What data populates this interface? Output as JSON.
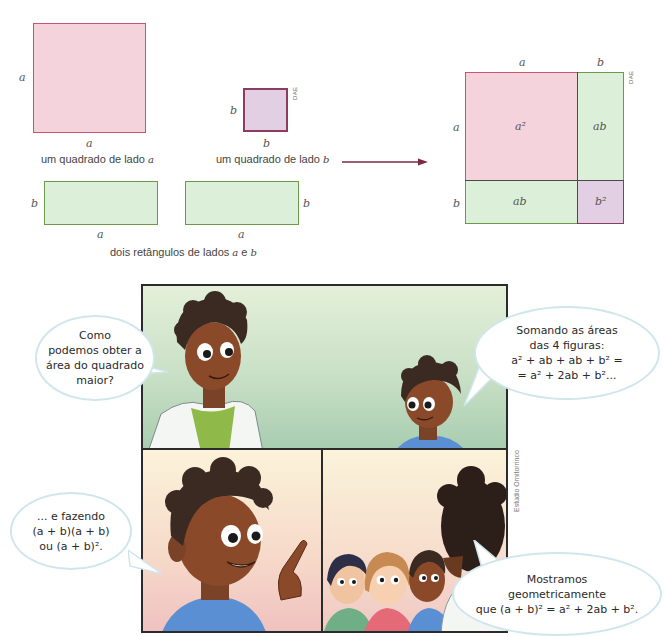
{
  "figures": {
    "square_a": {
      "side_label_left": "a",
      "side_label_bottom": "a",
      "caption_text": "um quadrado de lado ",
      "caption_var": "a",
      "color": "#f5d3dc",
      "border": "#c9556e"
    },
    "square_b": {
      "side_label_left": "b",
      "side_label_bottom": "b",
      "caption_text": "um quadrado de lado ",
      "caption_var": "b",
      "credit": "DAE",
      "color": "#e2cfe3",
      "border": "#8a3d5c"
    },
    "rectangles": {
      "rect1": {
        "side_label": "b",
        "bottom_label": "a"
      },
      "rect2": {
        "side_label": "b",
        "bottom_label": "a"
      },
      "caption_prefix": "dois retângulos de lados ",
      "caption_var1": "a",
      "caption_mid": " e ",
      "caption_var2": "b",
      "color": "#dcefd9",
      "border": "#6b9a4a"
    },
    "arrow": {
      "direction": "right",
      "color": "#7a2a45"
    },
    "composite_square": {
      "top_labels": [
        "a",
        "b"
      ],
      "left_labels": [
        "a",
        "b"
      ],
      "cells": {
        "top_left": "a²",
        "top_right": "ab",
        "bottom_left": "ab",
        "bottom_right": "b²"
      },
      "credit": "DAE"
    }
  },
  "comic": {
    "credit": "Estúdio Ornitorrinco",
    "panels": [
      {
        "id": "panel-1",
        "background": "green gradient",
        "characters": [
          "teacher in lab coat",
          "student boy"
        ]
      },
      {
        "id": "panel-2",
        "background": "peach gradient",
        "characters": [
          "student boy pointing"
        ]
      },
      {
        "id": "panel-3",
        "background": "peach gradient",
        "characters": [
          "teacher from behind",
          "three students"
        ]
      }
    ],
    "bubbles": {
      "teacher_question": [
        "Como",
        "podemos obter a",
        "área do quadrado",
        "maior?"
      ],
      "student_sum": [
        "Somando as áreas",
        "das 4 figuras:",
        "a² + ab + ab + b² =",
        "= a² + 2ab + b²..."
      ],
      "student_product": [
        "... e fazendo",
        "(a + b)(a + b)",
        "ou (a + b)²."
      ],
      "teacher_conclusion": [
        "Mostramos",
        "geometricamente",
        "que (a + b)² = a² + 2ab + b²."
      ]
    }
  }
}
